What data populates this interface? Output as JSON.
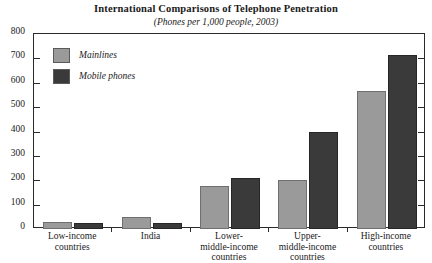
{
  "chart_data": {
    "type": "bar",
    "title": "International Comparisons of Telephone Penetration",
    "subtitle": "(Phones per 1,000 people, 2003)",
    "xlabel": "",
    "ylabel": "",
    "ylim": [
      0,
      800
    ],
    "ytick_step": 100,
    "yticks": [
      "800",
      "700",
      "600",
      "500",
      "400",
      "300",
      "200",
      "100",
      "0"
    ],
    "ytick_values": [
      800,
      700,
      600,
      500,
      400,
      300,
      200,
      100,
      0
    ],
    "grid": false,
    "legend_position": "upper-left-inside",
    "categories": [
      "Low-income countries",
      "India",
      "Lower-middle-income countries",
      "Upper-middle-income countries",
      "High-income countries"
    ],
    "category_lines": [
      [
        "Low-income",
        "countries"
      ],
      [
        "India"
      ],
      [
        "Lower-",
        "middle-income",
        "countries"
      ],
      [
        "Upper-",
        "middle-income",
        "countries"
      ],
      [
        "High-income",
        "countries"
      ]
    ],
    "series": [
      {
        "name": "Mainlines",
        "color": "#9a9a9a",
        "values": [
          30,
          48,
          175,
          200,
          565
        ]
      },
      {
        "name": "Mobile phones",
        "color": "#3a3a3a",
        "values": [
          26,
          25,
          210,
          400,
          715
        ]
      }
    ]
  },
  "colors": {
    "mainlines": "#9a9a9a",
    "mobile_phones": "#3a3a3a",
    "axis": "#2a2a2a",
    "background": "#ffffff"
  }
}
